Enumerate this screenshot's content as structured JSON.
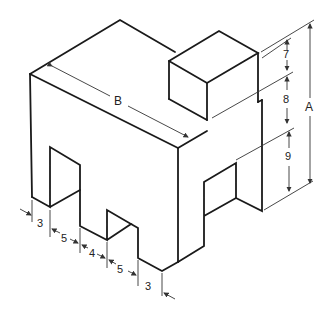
{
  "figure": {
    "dimensions": {
      "A": "A",
      "B": "B",
      "right_stack": [
        "7",
        "8",
        "9"
      ],
      "bottom_chain": [
        "3",
        "5",
        "4",
        "5",
        "3"
      ]
    }
  }
}
